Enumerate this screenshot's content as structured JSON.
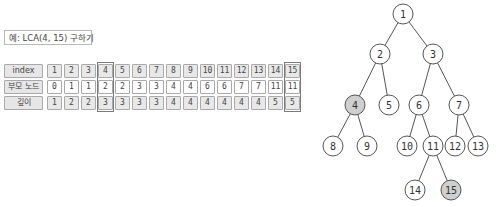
{
  "example": {
    "label": "예: LCA(4, 15) 구하기"
  },
  "table": {
    "rows": [
      {
        "header": "index",
        "values": [
          "1",
          "2",
          "3",
          "4",
          "5",
          "6",
          "7",
          "8",
          "9",
          "10",
          "11",
          "12",
          "13",
          "14",
          "15"
        ],
        "style": "shade"
      },
      {
        "header": "부모 노드",
        "values": [
          "0",
          "1",
          "1",
          "2",
          "2",
          "3",
          "3",
          "4",
          "4",
          "6",
          "6",
          "7",
          "7",
          "11",
          "11"
        ],
        "style": "white"
      },
      {
        "header": "깊이",
        "values": [
          "1",
          "2",
          "2",
          "3",
          "3",
          "3",
          "3",
          "4",
          "4",
          "4",
          "4",
          "4",
          "4",
          "5",
          "5"
        ],
        "style": "shade"
      }
    ],
    "highlighted_columns": [
      "4",
      "15"
    ]
  },
  "tree": {
    "nodes": [
      {
        "id": "1",
        "x": 403,
        "y": 14,
        "highlight": false
      },
      {
        "id": "2",
        "x": 380,
        "y": 54,
        "highlight": false
      },
      {
        "id": "3",
        "x": 433,
        "y": 54,
        "highlight": false
      },
      {
        "id": "4",
        "x": 355,
        "y": 105,
        "highlight": true
      },
      {
        "id": "5",
        "x": 389,
        "y": 105,
        "highlight": false
      },
      {
        "id": "6",
        "x": 419,
        "y": 105,
        "highlight": false
      },
      {
        "id": "7",
        "x": 459,
        "y": 105,
        "highlight": false
      },
      {
        "id": "8",
        "x": 333,
        "y": 146,
        "highlight": false
      },
      {
        "id": "9",
        "x": 367,
        "y": 146,
        "highlight": false
      },
      {
        "id": "10",
        "x": 407,
        "y": 146,
        "highlight": false
      },
      {
        "id": "11",
        "x": 433,
        "y": 146,
        "highlight": false
      },
      {
        "id": "12",
        "x": 455,
        "y": 146,
        "highlight": false
      },
      {
        "id": "13",
        "x": 478,
        "y": 146,
        "highlight": false
      },
      {
        "id": "14",
        "x": 415,
        "y": 190,
        "highlight": false
      },
      {
        "id": "15",
        "x": 451,
        "y": 190,
        "highlight": true
      }
    ],
    "edges": [
      [
        "1",
        "2"
      ],
      [
        "1",
        "3"
      ],
      [
        "2",
        "4"
      ],
      [
        "2",
        "5"
      ],
      [
        "3",
        "6"
      ],
      [
        "3",
        "7"
      ],
      [
        "4",
        "8"
      ],
      [
        "4",
        "9"
      ],
      [
        "6",
        "10"
      ],
      [
        "6",
        "11"
      ],
      [
        "7",
        "12"
      ],
      [
        "7",
        "13"
      ],
      [
        "11",
        "14"
      ],
      [
        "11",
        "15"
      ]
    ],
    "colors": {
      "highlight_fill": "#cfcfcf",
      "fill": "#ffffff",
      "stroke": "#555555"
    }
  }
}
